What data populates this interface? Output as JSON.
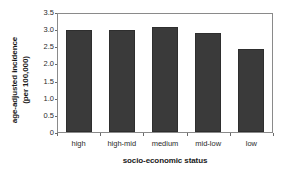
{
  "chart_data": {
    "type": "bar",
    "title": "",
    "subtitle": "",
    "xlabel": "socio-economic status",
    "ylabel_lines": [
      "age-adjusted incidence",
      "(per 100,000)"
    ],
    "ylabel": "age-adjusted incidence (per 100,000)",
    "categories": [
      "high",
      "high-mid",
      "medium",
      "mid-low",
      "low"
    ],
    "values": [
      2.99,
      2.97,
      3.07,
      2.9,
      2.42
    ],
    "ylim": [
      0,
      3.5
    ],
    "yticks": [
      0,
      0.5,
      1.0,
      1.5,
      2.0,
      2.5,
      3.0,
      3.5
    ],
    "ytick_labels": [
      "0",
      "0.5",
      "1.0",
      "1.5",
      "2.0",
      "2.5",
      "3.0",
      "3.5"
    ],
    "grid": false,
    "legend": null,
    "legend_position": "none",
    "bar_color": "#3a3a3a",
    "bar_edge_color": "#2e2e2e",
    "frame_color": "#8a8a8a",
    "background": "#ffffff"
  }
}
